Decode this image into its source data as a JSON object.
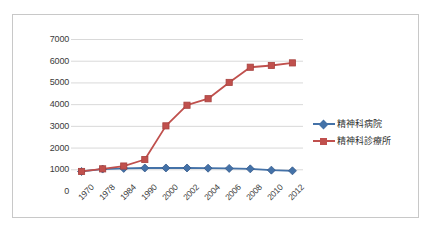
{
  "chart_data": {
    "type": "line",
    "title": "",
    "subtitle": "",
    "xlabel": "",
    "ylabel": "",
    "categories": [
      "1970",
      "1978",
      "1984",
      "1990",
      "2000",
      "2002",
      "2004",
      "2006",
      "2008",
      "2010",
      "2012"
    ],
    "ylim": [
      0,
      7000
    ],
    "ytick_labels": [
      "0",
      "1000",
      "2000",
      "3000",
      "4000",
      "5000",
      "6000",
      "7000"
    ],
    "ytick_values": [
      0,
      1000,
      2000,
      3000,
      4000,
      5000,
      6000,
      7000
    ],
    "grid": true,
    "legend_position": "right",
    "series": [
      {
        "name": "精神科病院",
        "color": "#4472a8",
        "marker": "diamond",
        "values": [
          900,
          1010,
          1040,
          1060,
          1060,
          1060,
          1050,
          1040,
          1020,
          960,
          930
        ]
      },
      {
        "name": "精神科診療所",
        "color": "#c0504d",
        "marker": "square",
        "values": [
          900,
          1020,
          1150,
          1450,
          3000,
          3950,
          4250,
          5000,
          5700,
          5780,
          5900
        ]
      }
    ]
  },
  "legend": {
    "items": [
      {
        "label": "精神科病院",
        "color": "#4472a8",
        "marker": "diamond"
      },
      {
        "label": "精神科診療所",
        "color": "#c0504d",
        "marker": "square"
      }
    ]
  }
}
